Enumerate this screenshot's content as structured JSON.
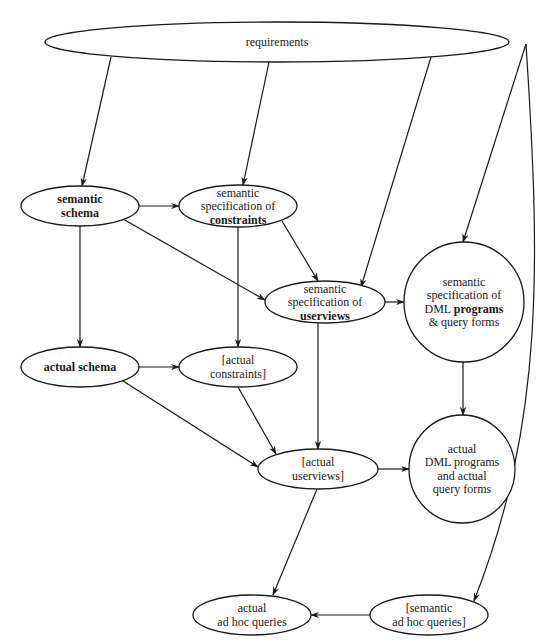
{
  "diagram": {
    "nodes": [
      {
        "id": "requirements",
        "cx": 277,
        "cy": 42,
        "rx": 232,
        "ry": 20,
        "lines": [
          [
            {
              "t": "requirements",
              "b": false
            }
          ]
        ]
      },
      {
        "id": "semantic-schema",
        "cx": 80,
        "cy": 206,
        "rx": 59,
        "ry": 20,
        "lines": [
          [
            {
              "t": "semantic",
              "b": true
            }
          ],
          [
            {
              "t": "schema",
              "b": true
            }
          ]
        ]
      },
      {
        "id": "semantic-spec-constraints",
        "cx": 238,
        "cy": 206,
        "rx": 59,
        "ry": 21,
        "lines": [
          [
            {
              "t": "semantic",
              "b": false
            }
          ],
          [
            {
              "t": "specification of",
              "b": false
            }
          ],
          [
            {
              "t": "constraints",
              "b": true
            }
          ]
        ]
      },
      {
        "id": "semantic-spec-userviews",
        "cx": 325,
        "cy": 302,
        "rx": 60,
        "ry": 21,
        "lines": [
          [
            {
              "t": "semantic",
              "b": false
            }
          ],
          [
            {
              "t": "specification of",
              "b": false
            }
          ],
          [
            {
              "t": "userviews",
              "b": true
            }
          ]
        ]
      },
      {
        "id": "semantic-spec-dml-programs",
        "cx": 464,
        "cy": 302,
        "rx": 60,
        "ry": 60,
        "lines": [
          [
            {
              "t": "semantic",
              "b": false
            }
          ],
          [
            {
              "t": "specification of",
              "b": false
            }
          ],
          [
            {
              "t": "DML ",
              "b": false
            },
            {
              "t": "programs",
              "b": true
            }
          ],
          [
            {
              "t": "& query forms",
              "b": false
            }
          ]
        ]
      },
      {
        "id": "actual-schema",
        "cx": 80,
        "cy": 367,
        "rx": 59,
        "ry": 20,
        "lines": [
          [
            {
              "t": "actual schema",
              "b": true
            }
          ]
        ]
      },
      {
        "id": "actual-constraints",
        "cx": 238,
        "cy": 367,
        "rx": 59,
        "ry": 20,
        "lines": [
          [
            {
              "t": "[actual",
              "b": false
            }
          ],
          [
            {
              "t": "constraints]",
              "b": false
            }
          ]
        ]
      },
      {
        "id": "actual-userviews",
        "cx": 318,
        "cy": 469,
        "rx": 60,
        "ry": 20,
        "lines": [
          [
            {
              "t": "[actual",
              "b": false
            }
          ],
          [
            {
              "t": "userviews]",
              "b": false
            }
          ]
        ]
      },
      {
        "id": "actual-dml-programs",
        "cx": 462,
        "cy": 469,
        "rx": 53,
        "ry": 54,
        "lines": [
          [
            {
              "t": "actual",
              "b": false
            }
          ],
          [
            {
              "t": "DML programs",
              "b": false
            }
          ],
          [
            {
              "t": "and actual",
              "b": false
            }
          ],
          [
            {
              "t": "query forms",
              "b": false
            }
          ]
        ]
      },
      {
        "id": "actual-adhoc-queries",
        "cx": 252,
        "cy": 615,
        "rx": 59,
        "ry": 20,
        "lines": [
          [
            {
              "t": "actual",
              "b": false
            }
          ],
          [
            {
              "t": "ad hoc queries",
              "b": false
            }
          ]
        ]
      },
      {
        "id": "semantic-adhoc-queries",
        "cx": 429,
        "cy": 615,
        "rx": 59,
        "ry": 20,
        "lines": [
          [
            {
              "t": "[semantic",
              "b": false
            }
          ],
          [
            {
              "t": "ad hoc queries]",
              "b": false
            }
          ]
        ]
      }
    ],
    "edges": [
      {
        "from": "requirements",
        "to": "semantic-schema",
        "d": "M 111 57 L 82 186"
      },
      {
        "from": "requirements",
        "to": "semantic-spec-constraints",
        "d": "M 269 62 L 243 185"
      },
      {
        "from": "requirements",
        "to": "semantic-spec-userviews",
        "d": "M 431 57 L 361 287"
      },
      {
        "from": "requirements",
        "to": "semantic-spec-dml-programs",
        "d": "M 526 44 L 463 242"
      },
      {
        "from": "requirements",
        "to": "semantic-adhoc-queries",
        "d": "M 526 44 C 540 260, 545 420, 474 601"
      },
      {
        "from": "semantic-schema",
        "to": "semantic-spec-constraints",
        "d": "M 139 206 L 179 206"
      },
      {
        "from": "semantic-schema",
        "to": "actual-schema",
        "d": "M 80 226 L 80 347"
      },
      {
        "from": "semantic-schema",
        "to": "semantic-spec-userviews",
        "d": "M 123 219 L 265 300"
      },
      {
        "from": "semantic-spec-constraints",
        "to": "semantic-spec-userviews",
        "d": "M 282 221 L 318 281"
      },
      {
        "from": "semantic-spec-constraints",
        "to": "actual-constraints",
        "d": "M 238 227 L 238 347"
      },
      {
        "from": "semantic-spec-userviews",
        "to": "semantic-spec-dml-programs",
        "d": "M 385 302 L 404 302"
      },
      {
        "from": "semantic-spec-userviews",
        "to": "actual-userviews",
        "d": "M 318 323 L 318 449"
      },
      {
        "from": "semantic-spec-dml-programs",
        "to": "actual-dml-programs",
        "d": "M 463 362 L 463 415"
      },
      {
        "from": "actual-schema",
        "to": "actual-constraints",
        "d": "M 139 367 L 179 367"
      },
      {
        "from": "actual-schema",
        "to": "actual-userviews",
        "d": "M 123 381 L 258 467"
      },
      {
        "from": "actual-constraints",
        "to": "actual-userviews",
        "d": "M 238 387 L 276 454"
      },
      {
        "from": "actual-userviews",
        "to": "actual-dml-programs",
        "d": "M 378 469 L 409 469"
      },
      {
        "from": "actual-userviews",
        "to": "actual-adhoc-queries",
        "d": "M 317 489 L 273 595"
      },
      {
        "from": "semantic-adhoc-queries",
        "to": "actual-adhoc-queries",
        "d": "M 370 615 L 311 615"
      }
    ]
  }
}
